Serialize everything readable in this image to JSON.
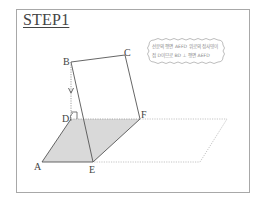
{
  "title": "STEP1",
  "diagram": {
    "points": {
      "A": "A",
      "B": "B",
      "C": "C",
      "D": "D",
      "E": "E",
      "F": "F"
    },
    "note": {
      "line1": "선분의 평면 AEFD 위로의 정사영이",
      "line2": "점 D이므로 BD ⊥ 평면 AEFD"
    },
    "shaded_region": "AEFD",
    "right_angle_at": "D",
    "colors": {
      "shade": "#d9d9d9",
      "line": "#555555",
      "dotted": "#b5b5b5",
      "frame": "#a8a8a8"
    }
  }
}
